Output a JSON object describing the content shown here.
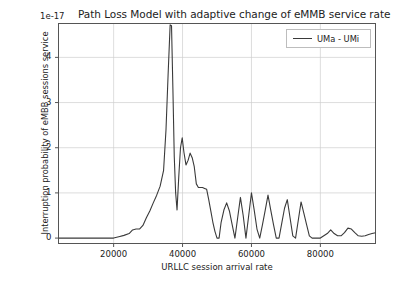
{
  "chart_data": {
    "type": "line",
    "title": "Path Loss Model with adaptive change of eMMB service rate",
    "xlabel": "URLLC session arrival rate",
    "ylabel": "Interruption probability of eMBB sessions service",
    "y_exponent_label": "1e-17",
    "y_scale": 1e-17,
    "grid": true,
    "legend_position": "upper right",
    "xlim": [
      4000,
      96000
    ],
    "ylim": [
      -0.12,
      4.75
    ],
    "xticks": [
      20000,
      40000,
      60000,
      80000
    ],
    "xtick_labels": [
      "20000",
      "40000",
      "60000",
      "80000"
    ],
    "yticks": [
      0,
      1,
      2,
      3,
      4
    ],
    "ytick_labels": [
      "0",
      "1",
      "2",
      "3",
      "4"
    ],
    "line_color": "#3a3a3a",
    "line_width": 1.1,
    "series": [
      {
        "name": "UMa - UMi",
        "x": [
          4000,
          10000,
          16000,
          20000,
          21500,
          23000,
          24500,
          25500,
          26500,
          27500,
          28500,
          29500,
          30500,
          31500,
          32500,
          33500,
          34500,
          35200,
          35800,
          36400,
          36800,
          37200,
          37600,
          38000,
          38400,
          38900,
          39400,
          39900,
          40400,
          41000,
          41600,
          42200,
          42800,
          43400,
          44000,
          44600,
          45200,
          45800,
          46400,
          47000,
          47600,
          48200,
          48800,
          49400,
          50000,
          50600,
          51200,
          52000,
          52800,
          53600,
          54400,
          55200,
          56000,
          56800,
          57600,
          58400,
          59200,
          60000,
          60800,
          61600,
          62400,
          63200,
          64000,
          64800,
          65600,
          66400,
          67200,
          68000,
          68800,
          69600,
          70400,
          71200,
          72000,
          72800,
          73600,
          74400,
          75200,
          76000,
          76800,
          77600,
          78400,
          79200,
          80000,
          81000,
          82000,
          83000,
          84000,
          85000,
          86000,
          87000,
          88000,
          89000,
          90000,
          91000,
          92000,
          93000,
          94000,
          95000,
          96000
        ],
        "y": [
          0.0,
          0.0,
          0.0,
          0.0,
          0.03,
          0.06,
          0.1,
          0.18,
          0.2,
          0.2,
          0.28,
          0.45,
          0.6,
          0.78,
          0.95,
          1.15,
          1.5,
          2.4,
          3.6,
          4.72,
          4.7,
          3.3,
          1.8,
          1.0,
          0.62,
          1.35,
          2.0,
          2.22,
          1.9,
          1.62,
          1.72,
          1.88,
          1.78,
          1.58,
          1.2,
          1.12,
          1.12,
          1.12,
          1.1,
          1.08,
          0.85,
          0.6,
          0.35,
          0.15,
          0.0,
          0.0,
          0.35,
          0.62,
          0.78,
          0.6,
          0.3,
          0.0,
          0.45,
          0.9,
          0.5,
          0.0,
          0.5,
          1.0,
          0.62,
          0.2,
          0.0,
          0.3,
          0.62,
          0.95,
          0.62,
          0.3,
          0.0,
          0.0,
          0.33,
          0.66,
          0.85,
          0.45,
          0.05,
          0.0,
          0.4,
          0.8,
          0.55,
          0.3,
          0.05,
          0.0,
          0.0,
          0.0,
          0.0,
          0.05,
          0.1,
          0.18,
          0.1,
          0.05,
          0.05,
          0.12,
          0.22,
          0.2,
          0.12,
          0.05,
          0.04,
          0.05,
          0.08,
          0.1,
          0.12
        ]
      }
    ]
  },
  "legend": {
    "entries": [
      {
        "label": "UMa - UMi"
      }
    ]
  }
}
